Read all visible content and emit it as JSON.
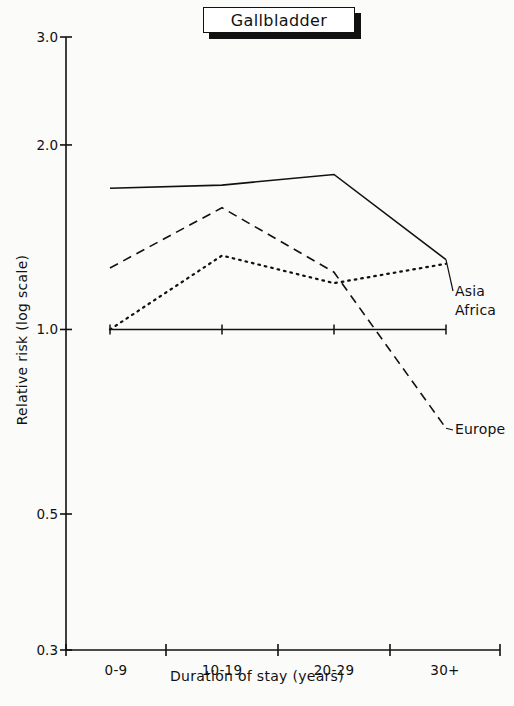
{
  "figure": {
    "title": "Gallbladder",
    "background_color": "#fbfbfa",
    "ink_color": "#111111"
  },
  "axis_titles": {
    "x": "Duration of stay (years)",
    "y": "Relative risk (log scale)"
  },
  "series_labels": {
    "asia": "Asia",
    "africa": "Africa",
    "europe": "Europe"
  },
  "chart_data": {
    "type": "line",
    "title": "Gallbladder",
    "xlabel": "Duration of stay (years)",
    "ylabel": "Relative risk (log scale)",
    "yscale": "log",
    "ylim": [
      0.3,
      3.0
    ],
    "ytick_labels": [
      "3.0",
      "2.0",
      "1.0",
      "0.5",
      "0.3"
    ],
    "ytick_values": [
      3.0,
      2.0,
      1.0,
      0.5,
      0.3
    ],
    "categories": [
      "0-9",
      "10-19",
      "20-29",
      "30+"
    ],
    "grid": false,
    "legend_position": "right-inline-labels",
    "reference_line": {
      "value": 1.0,
      "style": "solid-with-plus-markers",
      "marker": "+"
    },
    "series": [
      {
        "name": "Asia",
        "style": "solid",
        "values": [
          1.7,
          1.72,
          1.79,
          1.3
        ]
      },
      {
        "name": "Africa",
        "style": "dotted",
        "values": [
          1.0,
          1.32,
          1.19,
          1.28
        ]
      },
      {
        "name": "Europe",
        "style": "dashed",
        "values": [
          1.26,
          1.58,
          1.24,
          0.69
        ]
      }
    ]
  }
}
